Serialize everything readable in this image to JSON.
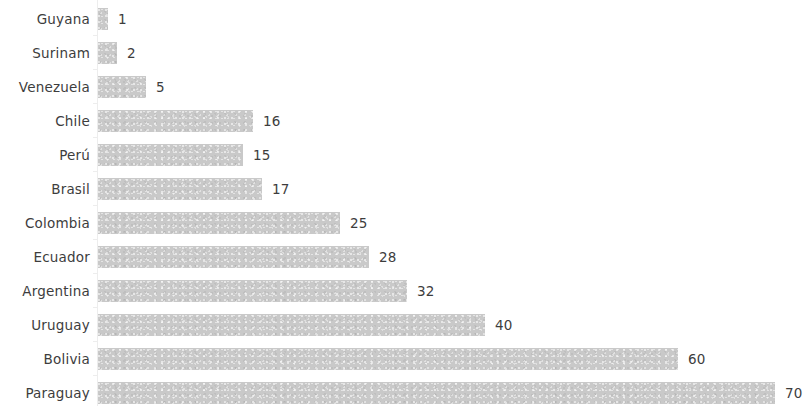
{
  "chart_data": {
    "type": "bar",
    "orientation": "horizontal",
    "title": "",
    "subtitle": "",
    "xlabel": "",
    "ylabel": "",
    "categories": [
      "Guyana",
      "Surinam",
      "Venezuela",
      "Chile",
      "Perú",
      "Brasil",
      "Colombia",
      "Ecuador",
      "Argentina",
      "Uruguay",
      "Bolivia",
      "Paraguay"
    ],
    "values": [
      1,
      2,
      5,
      16,
      15,
      17,
      25,
      28,
      32,
      40,
      60,
      70
    ],
    "value_labels": [
      "1",
      "2",
      "5",
      "16",
      "15",
      "17",
      "25",
      "28",
      "32",
      "40",
      "60",
      "70"
    ],
    "xlim": [
      0,
      73
    ],
    "grid": false,
    "legend": null,
    "data_labels_position": "outside-end",
    "axis_tick_labels": []
  },
  "style": {
    "bar_color": "#c9c9c9",
    "text_color": "#3d3d3d",
    "background_color": "#ffffff",
    "axis_color": "#ededed"
  }
}
